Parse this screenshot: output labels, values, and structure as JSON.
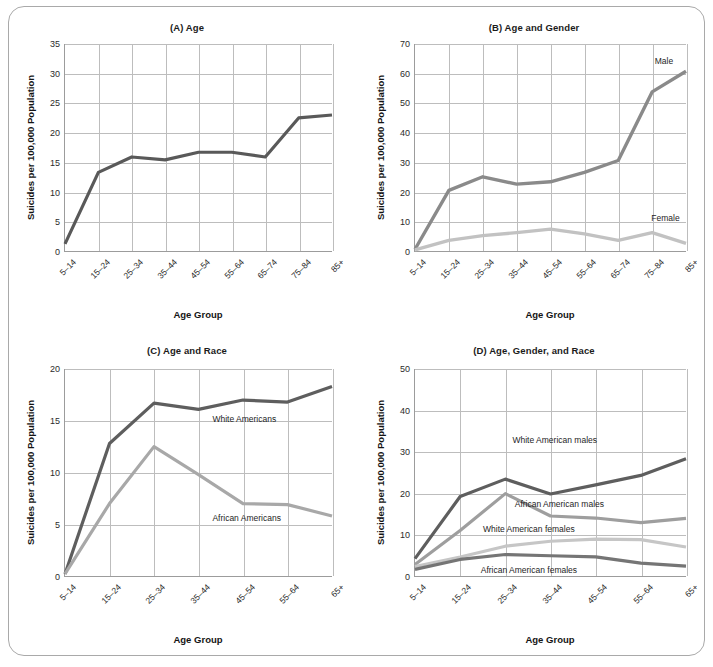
{
  "figure": {
    "border_color": "#a9a9a9",
    "background": "#ffffff"
  },
  "colors": {
    "dark_gray": "#595959",
    "mid_dark_gray": "#6e6e6e",
    "mid_gray": "#969696",
    "light_gray": "#b5b5b5",
    "lighter_gray": "#c8c8c8",
    "grid": "#bdbdbd",
    "axis": "#9c9c9c",
    "text": "#1b1b1b"
  },
  "shared": {
    "xlabel": "Age Group",
    "ylabel": "Suicides per 100,000 Population"
  },
  "chart_data": [
    {
      "id": "panel-a",
      "type": "line",
      "title": "(A) Age",
      "xlabel": "Age Group",
      "ylabel": "Suicides per 100,000 Population",
      "categories": [
        "5–14",
        "15–24",
        "25–34",
        "35–44",
        "45–54",
        "55–64",
        "65–74",
        "75–84",
        "85+"
      ],
      "yticks": [
        0,
        5,
        10,
        15,
        20,
        25,
        30,
        35
      ],
      "ylim": [
        0,
        35
      ],
      "grid": true,
      "legend_position": "none",
      "series": [
        {
          "name": "All",
          "color": "#595959",
          "width": 3.2,
          "values": [
            1.2,
            13.3,
            15.9,
            15.4,
            16.7,
            16.7,
            15.9,
            22.5,
            23.0
          ],
          "label": null
        }
      ]
    },
    {
      "id": "panel-b",
      "type": "line",
      "title": "(B) Age and Gender",
      "xlabel": "Age Group",
      "ylabel": "Suicides per 100,000 Population",
      "categories": [
        "5–14",
        "15–24",
        "25–34",
        "35–44",
        "45–54",
        "55–64",
        "65–74",
        "75–84",
        "85+"
      ],
      "yticks": [
        0,
        10,
        20,
        30,
        40,
        50,
        60,
        70
      ],
      "ylim": [
        0,
        70
      ],
      "grid": true,
      "legend_position": "inline",
      "series": [
        {
          "name": "Male",
          "color": "#8a8a8a",
          "width": 3.4,
          "values": [
            0.6,
            20.5,
            25.1,
            22.6,
            23.4,
            26.6,
            30.6,
            53.8,
            60.8
          ],
          "label": "Male",
          "label_x": 7.05,
          "label_y": 64.0
        },
        {
          "name": "Female",
          "color": "#c2c2c2",
          "width": 3.4,
          "values": [
            0.4,
            3.6,
            5.2,
            6.2,
            7.4,
            5.8,
            3.6,
            6.2,
            2.6
          ],
          "label": "Female",
          "label_x": 6.95,
          "label_y": 11.2
        }
      ]
    },
    {
      "id": "panel-c",
      "type": "line",
      "title": "(C) Age and Race",
      "xlabel": "Age Group",
      "ylabel": "Suicides per 100,000 Population",
      "categories": [
        "5–14",
        "15–24",
        "25–34",
        "35–44",
        "45–54",
        "55–64",
        "65+"
      ],
      "yticks": [
        0,
        5,
        10,
        15,
        20
      ],
      "ylim": [
        0,
        20
      ],
      "grid": true,
      "legend_position": "inline",
      "series": [
        {
          "name": "White Americans",
          "color": "#5e5e5e",
          "width": 3.2,
          "values": [
            0.2,
            12.8,
            16.7,
            16.1,
            17.0,
            16.8,
            18.3
          ],
          "label": "White Americans",
          "label_x": 3.3,
          "label_y": 15.1
        },
        {
          "name": "African Americans",
          "color": "#a8a8a8",
          "width": 3.2,
          "values": [
            0.2,
            7.0,
            12.5,
            9.8,
            7.0,
            6.9,
            5.8
          ],
          "label": "African Americans",
          "label_x": 3.3,
          "label_y": 5.6
        }
      ]
    },
    {
      "id": "panel-d",
      "type": "line",
      "title": "(D) Age, Gender, and Race",
      "xlabel": "Age Group",
      "ylabel": "Suicides per 100,000 Population",
      "categories": [
        "5–14",
        "15–24",
        "25–34",
        "35–44",
        "45–54",
        "55–64",
        "65+"
      ],
      "yticks": [
        0,
        10,
        20,
        30,
        40,
        50
      ],
      "ylim": [
        0,
        50
      ],
      "grid": true,
      "legend_position": "inline",
      "series": [
        {
          "name": "White American males",
          "color": "#5e5e5e",
          "width": 3.2,
          "values": [
            4.2,
            19.2,
            23.4,
            19.8,
            22.0,
            24.3,
            28.3
          ],
          "label": "White American males",
          "label_x": 2.15,
          "label_y": 32.8
        },
        {
          "name": "African American males",
          "color": "#9e9e9e",
          "width": 3.2,
          "values": [
            2.8,
            11.0,
            19.9,
            14.5,
            14.0,
            12.9,
            13.9
          ],
          "label": "African American males",
          "label_x": 2.2,
          "label_y": 17.2
        },
        {
          "name": "White American females",
          "color": "#c6c6c6",
          "width": 3.2,
          "values": [
            2.3,
            4.6,
            7.2,
            8.4,
            8.9,
            8.8,
            7.0
          ],
          "label": "White American females",
          "label_x": 1.5,
          "label_y": 11.2
        },
        {
          "name": "African American females",
          "color": "#757575",
          "width": 3.2,
          "values": [
            1.6,
            4.0,
            5.2,
            4.9,
            4.6,
            3.1,
            2.4
          ],
          "label": "African American females",
          "label_x": 1.45,
          "label_y": 1.4
        }
      ]
    }
  ]
}
